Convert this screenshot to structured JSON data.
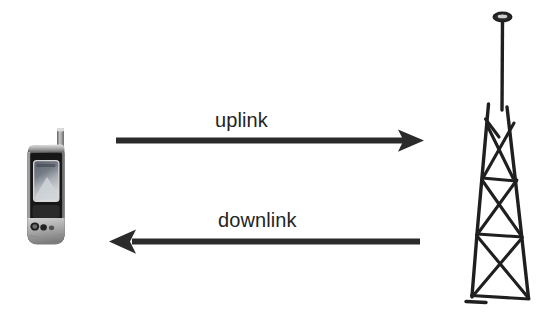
{
  "diagram": {
    "background_color": "#ffffff",
    "stroke_color": "#242424",
    "labels": {
      "uplink": "uplink",
      "downlink": "downlink"
    },
    "arrows": [
      {
        "name": "uplink-arrow",
        "label": "uplink",
        "direction": "right",
        "from": "mobile-phone",
        "to": "cell-tower",
        "color": "#2b2b2b",
        "x_start": 118,
        "x_end": 422,
        "y": 140,
        "line_thickness": 6
      },
      {
        "name": "downlink-arrow",
        "label": "downlink",
        "direction": "left",
        "from": "cell-tower",
        "to": "mobile-phone",
        "color": "#2b2b2b",
        "x_start": 417,
        "x_end": 110,
        "y": 240,
        "line_thickness": 6
      }
    ],
    "nodes": [
      {
        "name": "mobile-phone",
        "icon": "mobile-phone-icon",
        "description": "Grayscale flip-style mobile handset with stub antenna, display screen and keypad",
        "side": "left",
        "colors": {
          "body_dark": "#1c1c1c",
          "body_light": "#b9b9b9",
          "screen_top": "#6e7580",
          "screen_bottom": "#cfd3d8",
          "antenna": "#8a8a8a"
        }
      },
      {
        "name": "cell-tower",
        "icon": "cell-tower-icon",
        "description": "Hand-drawn lattice radio mast with three cross-braced sections and a disc antenna on top",
        "side": "right",
        "sections": 3,
        "colors": {
          "stroke": "#1f1f1f"
        }
      }
    ]
  }
}
